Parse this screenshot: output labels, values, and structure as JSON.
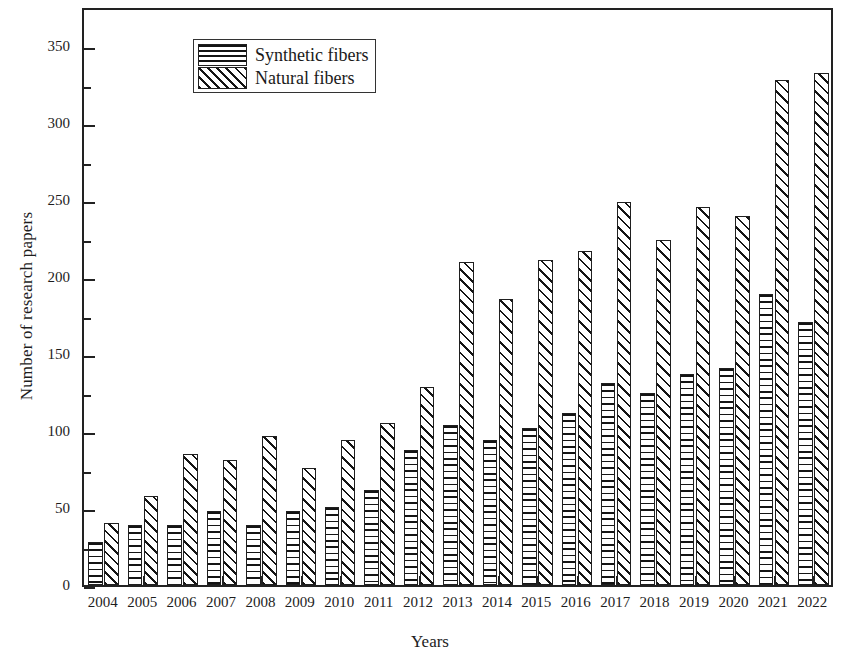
{
  "chart_data": {
    "type": "bar",
    "title": "",
    "xlabel": "Years",
    "ylabel": "Number of research papers",
    "categories": [
      "2004",
      "2005",
      "2006",
      "2007",
      "2008",
      "2009",
      "2010",
      "2011",
      "2012",
      "2013",
      "2014",
      "2015",
      "2016",
      "2017",
      "2018",
      "2019",
      "2020",
      "2021",
      "2022"
    ],
    "series": [
      {
        "name": "Synthetic fibers",
        "pattern": "horizontal-lines",
        "values": [
          28,
          39,
          39,
          48,
          39,
          48,
          51,
          62,
          88,
          104,
          94,
          102,
          112,
          131,
          125,
          137,
          141,
          189,
          171
        ]
      },
      {
        "name": "Natural fibers",
        "pattern": "diagonal-hatch",
        "values": [
          40,
          58,
          85,
          81,
          97,
          76,
          94,
          105,
          129,
          210,
          186,
          211,
          217,
          249,
          224,
          246,
          240,
          328,
          333
        ]
      }
    ],
    "ylim": [
      0,
      375
    ],
    "yticks": [
      0,
      50,
      100,
      150,
      200,
      250,
      300,
      350
    ],
    "ytick_labels": [
      "0",
      "50",
      "100",
      "150",
      "200",
      "250",
      "300",
      "350"
    ],
    "yminor_interval": 25,
    "grid": false,
    "legend_position": "top-left",
    "colors": {
      "axis": "#222222",
      "bar_outline": "#1f1f1f",
      "hatch": "#141414",
      "background": "#ffffff"
    }
  },
  "legend": {
    "items": [
      {
        "label": "Synthetic fibers",
        "swatch": "horizontal-lines-swatch"
      },
      {
        "label": "Natural fibers",
        "swatch": "diagonal-hatch-swatch"
      }
    ]
  }
}
